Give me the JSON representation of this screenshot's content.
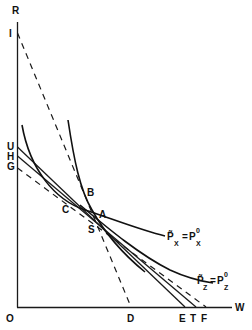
{
  "diagram": {
    "axes": {
      "y_label": "R",
      "x_label": "W",
      "origin_label": "O"
    },
    "y_axis_points": [
      "I",
      "U",
      "H",
      "G"
    ],
    "x_axis_points": [
      "D",
      "E",
      "T",
      "F"
    ],
    "interior_points": [
      "B",
      "A",
      "C",
      "S"
    ],
    "curves": {
      "px": {
        "label_main": "P̃",
        "label_sub": "X",
        "label_eq": "=",
        "label_rhs": "P",
        "label_rhs_sub": "X",
        "label_rhs_sup": "0"
      },
      "pz": {
        "label_main": "P̃",
        "label_sub": "Z",
        "label_eq": "=",
        "label_rhs": "P",
        "label_rhs_sub": "Z",
        "label_rhs_sup": "0"
      }
    },
    "lines": [
      {
        "from": "I",
        "to": "D",
        "style": "dashed"
      },
      {
        "from": "U",
        "to": "E",
        "style": "solid"
      },
      {
        "from": "H",
        "to": "T",
        "style": "solid"
      },
      {
        "from": "G",
        "to": "F",
        "style": "dashed"
      }
    ]
  }
}
